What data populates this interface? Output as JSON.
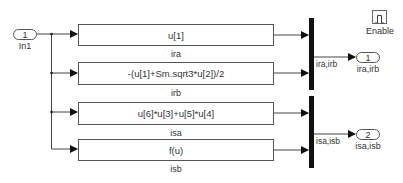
{
  "inport": {
    "number": "1",
    "label": "In1"
  },
  "blocks": [
    {
      "expression": "u[1]",
      "label": "ira"
    },
    {
      "expression": "-(u[1]+Sm.sqrt3*u[2])/2",
      "label": "irb"
    },
    {
      "expression": "u[6]*u[3]+u[5]*u[4]",
      "label": "isa"
    },
    {
      "expression": "f(u)",
      "label": "isb"
    }
  ],
  "muxes": [
    {
      "signal_label": "ira,irb"
    },
    {
      "signal_label": "isa,isb"
    }
  ],
  "outports": [
    {
      "number": "1",
      "label": "ira,irb"
    },
    {
      "number": "2",
      "label": "isa,isb"
    }
  ],
  "enable": {
    "label": "Enable",
    "icon": "pulse-icon"
  }
}
